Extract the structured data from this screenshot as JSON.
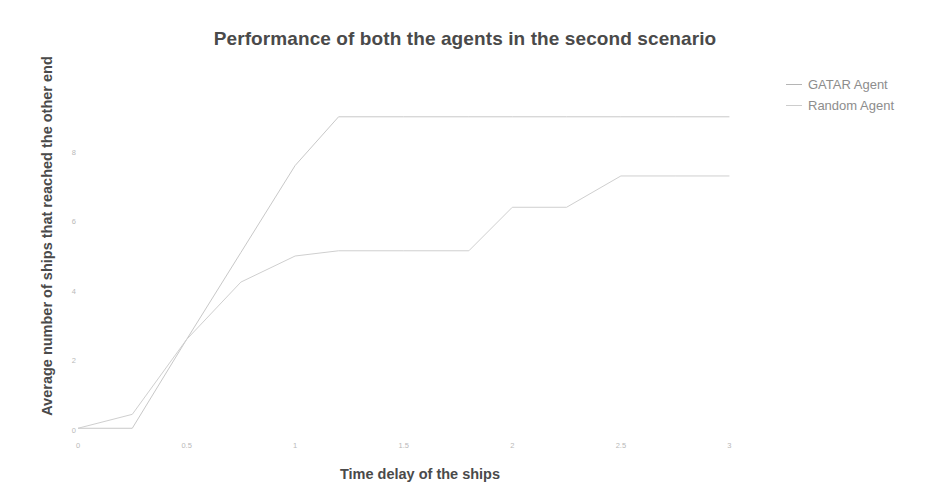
{
  "chart_data": {
    "type": "line",
    "title": "Performance of both the agents in the second scenario",
    "xlabel": "Time delay of the ships",
    "ylabel": "Average number of ships that reached the other end",
    "xlim": [
      0,
      3.15
    ],
    "ylim": [
      0,
      10
    ],
    "grid": false,
    "legend_position": "top-right-outside",
    "xticks": [
      "0",
      "0.5",
      "1",
      "1.5",
      "2",
      "2.5",
      "3"
    ],
    "xtick_values": [
      0,
      0.5,
      1,
      1.5,
      2,
      2.5,
      3
    ],
    "yticks": [
      "0",
      "2",
      "4",
      "6",
      "8"
    ],
    "ytick_values": [
      0,
      2,
      4,
      6,
      8
    ],
    "series": [
      {
        "name": "GATAR Agent",
        "color": "#c8c8c8",
        "x": [
          0,
          0.25,
          0.5,
          0.75,
          1.0,
          1.2,
          1.5,
          1.8,
          2.0,
          2.25,
          2.5,
          2.75,
          3.0
        ],
        "y": [
          0.05,
          0.05,
          2.6,
          5.1,
          7.6,
          9.0,
          9.0,
          9.0,
          9.0,
          9.0,
          9.0,
          9.0,
          9.0
        ]
      },
      {
        "name": "Random Agent",
        "color": "#cfcfcf",
        "x": [
          0,
          0.25,
          0.5,
          0.75,
          1.0,
          1.2,
          1.5,
          1.8,
          2.0,
          2.25,
          2.5,
          2.75,
          3.0
        ],
        "y": [
          0.05,
          0.45,
          2.6,
          4.25,
          5.0,
          5.15,
          5.15,
          5.15,
          6.4,
          6.4,
          7.3,
          7.3,
          7.3
        ]
      }
    ]
  },
  "legend": {
    "items": [
      {
        "label": "GATAR Agent",
        "color": "#b5b5b5"
      },
      {
        "label": "Random Agent",
        "color": "#cdcdcd"
      }
    ]
  }
}
